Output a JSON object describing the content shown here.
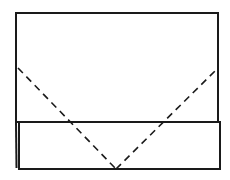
{
  "diagram": {
    "type": "origami-fold-step",
    "background": "#ffffff",
    "stroke_color": "#1a1a1a",
    "paper": {
      "x": 16,
      "y": 13,
      "width": 202,
      "height": 109
    },
    "folded_band": {
      "x": 19,
      "y": 122,
      "width": 201,
      "height": 47,
      "left_edge_double_line": true
    },
    "valley_fold_lines": {
      "style": "dashed",
      "points": [
        [
          18,
          68
        ],
        [
          116,
          169
        ],
        [
          216,
          70
        ]
      ]
    }
  }
}
